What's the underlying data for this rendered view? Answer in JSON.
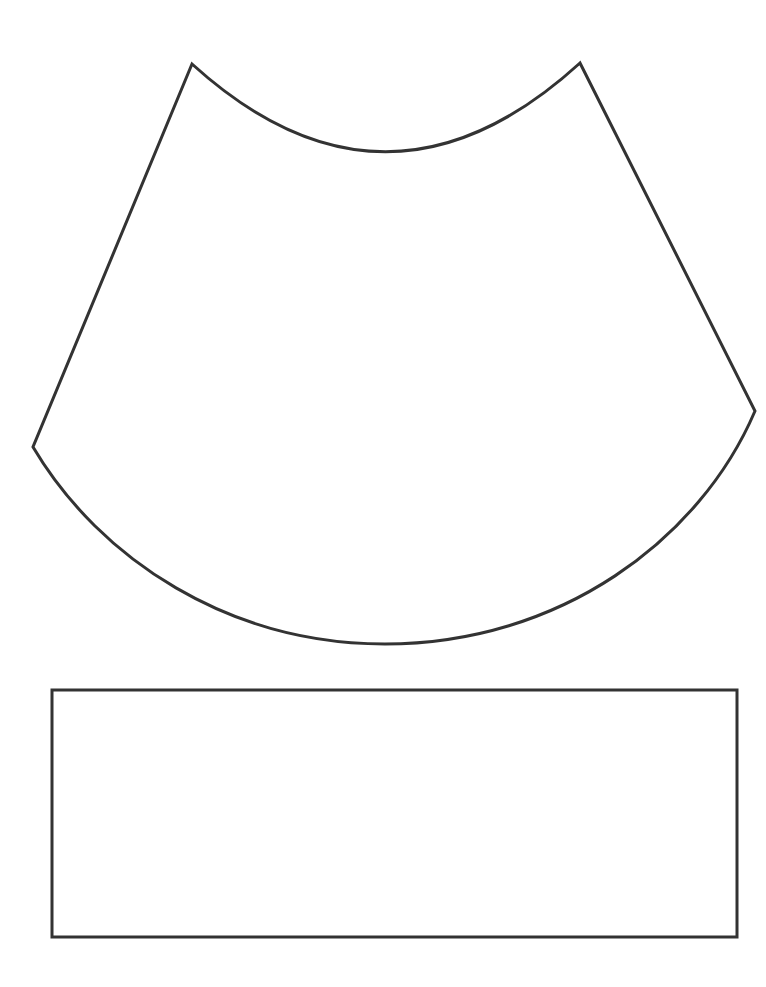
{
  "diagram": {
    "type": "cone-net-template",
    "stroke_color": "#333333",
    "background_color": "#ffffff",
    "stroke_width": 3,
    "shapes": [
      {
        "name": "annular-sector",
        "points": {
          "inner_left": [
            192,
            64
          ],
          "inner_right": [
            580,
            63
          ],
          "outer_left": [
            33,
            447
          ],
          "outer_right": [
            755,
            411
          ],
          "inner_arc_control": [
            386,
            240
          ],
          "outer_arc_control": [
            384,
            840
          ]
        }
      },
      {
        "name": "rectangle",
        "x": 52,
        "y": 690,
        "width": 685,
        "height": 247
      }
    ]
  }
}
